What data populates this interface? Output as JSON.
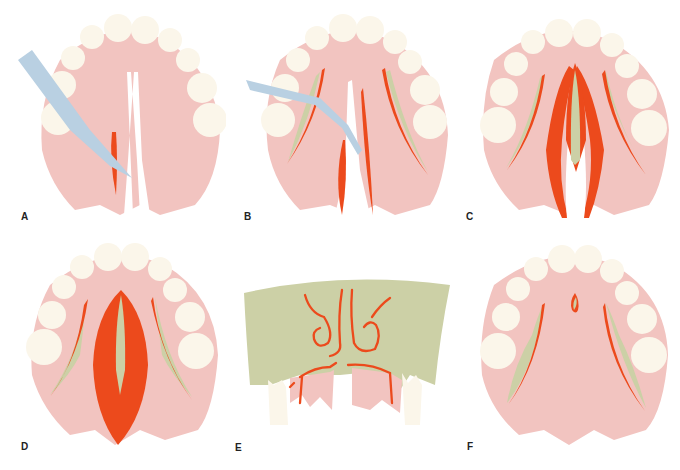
{
  "figure": {
    "panels": [
      {
        "id": "A",
        "label": "A",
        "description": "Scalpel making initial incision along cleft margin"
      },
      {
        "id": "B",
        "label": "B",
        "description": "Elevator reflecting mucoperiosteal flaps with lateral relaxing incisions"
      },
      {
        "id": "C",
        "label": "C",
        "description": "Flaps elevated exposing nasal layer and bone"
      },
      {
        "id": "D",
        "label": "D",
        "description": "Nasal layer closed; oral layer approximated"
      },
      {
        "id": "E",
        "label": "E",
        "description": "Coronal section showing nasal floor and layered closure"
      },
      {
        "id": "F",
        "label": "F",
        "description": "Completed palatal closure with lateral relaxing areas"
      }
    ]
  },
  "colors": {
    "mucosa": "#f2c4c0",
    "teeth": "#fbf6ea",
    "incision": "#ec4a1c",
    "bone": "#ccd0a6",
    "instrument": "#b9d0e2",
    "background": "#ffffff",
    "label": "#222222"
  }
}
